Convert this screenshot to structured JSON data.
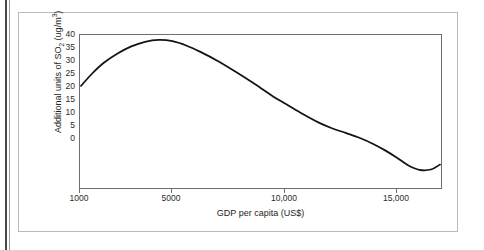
{
  "figure": {
    "background_color": "#ffffff",
    "border_color": "#b9b9b9",
    "axis_color": "#6e6e6e",
    "curve_color": "#141414"
  },
  "chart_data": {
    "type": "line",
    "title": "",
    "xlabel": "GDP per capita (US$)",
    "ylabel": "Additional units of SO2 (ug/m3)",
    "ylabel_parts": {
      "lead": "Additional units of SO",
      "sub": "2",
      "mid": " (ug/m",
      "sup": "3",
      "tail": ")"
    },
    "grid": false,
    "legend": "none",
    "xscale": "linear",
    "xlim": [
      1000,
      16700
    ],
    "ylim": [
      -9.6,
      40
    ],
    "xticks": [
      1000,
      5000,
      10000,
      15000
    ],
    "xtick_labels": [
      "1000",
      "5000",
      "10,000",
      "15,000"
    ],
    "yticks": [
      0,
      5,
      10,
      15,
      20,
      25,
      30,
      35,
      40
    ],
    "ytick_labels": [
      "0",
      "5",
      "10",
      "15",
      "20",
      "25",
      "30",
      "35",
      "40"
    ],
    "series": [
      {
        "name": "Additional SO2 per unit GDP",
        "x": [
          1000,
          1500,
          2000,
          2600,
          3200,
          3800,
          4400,
          5000,
          5600,
          6200,
          7000,
          7800,
          8600,
          9400,
          10000,
          10700,
          11400,
          12000,
          12600,
          13200,
          13800,
          14300,
          14800,
          15300,
          15800,
          16300,
          16700
        ],
        "y": [
          23.5,
          27.6,
          31.0,
          34.0,
          36.3,
          37.8,
          38.4,
          38.0,
          36.6,
          34.6,
          31.5,
          27.9,
          24.1,
          20.1,
          17.5,
          14.4,
          11.6,
          9.7,
          8.2,
          6.6,
          4.6,
          2.6,
          0.3,
          -2.2,
          -3.7,
          -3.6,
          -2.0
        ]
      }
    ]
  }
}
